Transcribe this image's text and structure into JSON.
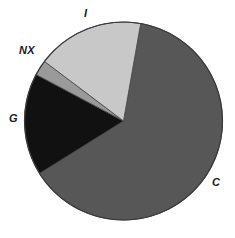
{
  "chart_data": {
    "type": "pie",
    "title": "",
    "subtitle": "",
    "xlabel": "",
    "ylabel": "",
    "grid": false,
    "legend_position": "none",
    "label_placement": "outside",
    "start_angle_deg": 10,
    "direction": "clockwise",
    "center": {
      "x": 123.5,
      "y": 121
    },
    "radius": 99,
    "categories": [
      "C",
      "G",
      "NX",
      "I"
    ],
    "values": [
      63.3,
      16.7,
      2.5,
      17.5
    ],
    "colors": [
      "#575757",
      "#111111",
      "#9a9a9a",
      "#c8c8c8"
    ],
    "slices": [
      {
        "label": "C",
        "value": 63.3,
        "angle_deg": 228,
        "start_deg": 10,
        "end_deg": 238,
        "color": "#575757",
        "label_x": 212,
        "label_y": 177
      },
      {
        "label": "G",
        "value": 16.7,
        "angle_deg": 60,
        "start_deg": 238,
        "end_deg": 298,
        "color": "#111111",
        "label_x": 9,
        "label_y": 113
      },
      {
        "label": "NX",
        "value": 2.5,
        "angle_deg": 9,
        "start_deg": 298,
        "end_deg": 307,
        "color": "#9a9a9a",
        "label_x": 19,
        "label_y": 45
      },
      {
        "label": "I",
        "value": 17.5,
        "angle_deg": 63,
        "start_deg": 307,
        "end_deg": 370,
        "color": "#c8c8c8",
        "label_x": 84,
        "label_y": 8
      }
    ],
    "outline_color": "#3a3a3a",
    "background": "#ffffff"
  },
  "labels": {
    "I": "I",
    "NX": "NX",
    "G": "G",
    "C": "C"
  }
}
